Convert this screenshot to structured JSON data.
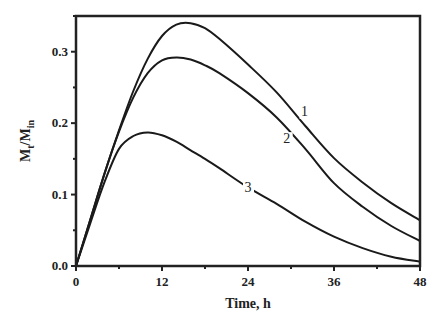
{
  "chart_data": {
    "type": "line",
    "title": "",
    "xlabel": "Time, h",
    "ylabel": "Mt/Min",
    "ylabel_main": "M",
    "ylabel_sub1": "t",
    "ylabel_mid": "/M",
    "ylabel_sub2": "in",
    "xlim": [
      0,
      48
    ],
    "ylim": [
      0,
      0.35
    ],
    "x_ticks": [
      "0",
      "12",
      "24",
      "36",
      "48"
    ],
    "y_ticks": [
      "0.0",
      "0.1",
      "0.2",
      "0.3"
    ],
    "grid": false,
    "legend": "inline curve labels",
    "x": [
      0,
      2,
      4,
      6,
      8,
      10,
      12,
      14,
      16,
      18,
      20,
      24,
      28,
      32,
      36,
      40,
      44,
      48
    ],
    "series": [
      {
        "name": "1",
        "values": [
          0,
          0.065,
          0.13,
          0.19,
          0.245,
          0.29,
          0.322,
          0.338,
          0.34,
          0.333,
          0.318,
          0.282,
          0.243,
          0.196,
          0.151,
          0.117,
          0.088,
          0.064
        ]
      },
      {
        "name": "2",
        "values": [
          0,
          0.065,
          0.13,
          0.188,
          0.236,
          0.27,
          0.288,
          0.292,
          0.289,
          0.281,
          0.27,
          0.242,
          0.208,
          0.164,
          0.116,
          0.083,
          0.056,
          0.035
        ]
      },
      {
        "name": "3",
        "values": [
          0,
          0.06,
          0.118,
          0.164,
          0.182,
          0.187,
          0.183,
          0.174,
          0.162,
          0.15,
          0.137,
          0.11,
          0.087,
          0.062,
          0.041,
          0.025,
          0.013,
          0.006
        ]
      }
    ],
    "annotations": [
      {
        "text": "1",
        "x": 31.9,
        "y": 0.21
      },
      {
        "text": "2",
        "x": 29.4,
        "y": 0.172
      },
      {
        "text": "3",
        "x": 24,
        "y": 0.104
      }
    ]
  }
}
